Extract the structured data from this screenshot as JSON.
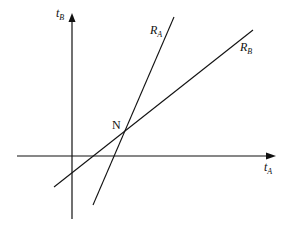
{
  "diagram": {
    "axes": {
      "vertical_label": "t",
      "vertical_sub": "B",
      "horizontal_label": "t",
      "horizontal_sub": "A"
    },
    "lines": [
      {
        "id": "RA",
        "label": "R",
        "sub": "A"
      },
      {
        "id": "RB",
        "label": "R",
        "sub": "B"
      }
    ],
    "intersection_label": "N",
    "colors": {
      "stroke": "#111111",
      "background": "#ffffff"
    }
  }
}
